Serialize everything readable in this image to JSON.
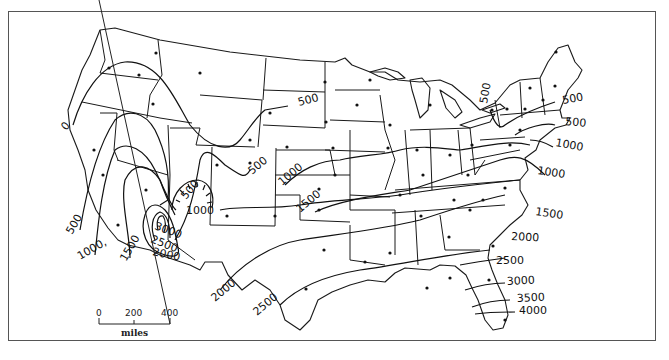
{
  "figure": {
    "type": "contour map of the contiguous United States",
    "contour_labels": [
      {
        "value": "0",
        "x": 66,
        "y": 131,
        "rotate": -50
      },
      {
        "value": "500",
        "x": 72,
        "y": 235,
        "rotate": -60
      },
      {
        "value": "1000,",
        "x": 80,
        "y": 260,
        "rotate": -30
      },
      {
        "value": "1500",
        "x": 126,
        "y": 262,
        "rotate": -60
      },
      {
        "value": "2000",
        "x": 152,
        "y": 255,
        "rotate": 12
      },
      {
        "value": "2500",
        "x": 150,
        "y": 242,
        "rotate": 22
      },
      {
        "value": "3000",
        "x": 154,
        "y": 229,
        "rotate": 20
      },
      {
        "value": "1000",
        "x": 186,
        "y": 214,
        "rotate": 0
      },
      {
        "value": "500",
        "x": 186,
        "y": 200,
        "rotate": -50
      },
      {
        "value": "500",
        "x": 252,
        "y": 175,
        "rotate": -40
      },
      {
        "value": "1000",
        "x": 282,
        "y": 186,
        "rotate": -40
      },
      {
        "value": "500",
        "x": 299,
        "y": 106,
        "rotate": -15
      },
      {
        "value": "1500",
        "x": 300,
        "y": 213,
        "rotate": -40
      },
      {
        "value": "2000",
        "x": 215,
        "y": 302,
        "rotate": -40
      },
      {
        "value": "2500",
        "x": 257,
        "y": 316,
        "rotate": -40
      },
      {
        "value": "500",
        "x": 487,
        "y": 104,
        "rotate": -80
      },
      {
        "value": "500",
        "x": 563,
        "y": 104,
        "rotate": -10
      },
      {
        "value": "500",
        "x": 565,
        "y": 125,
        "rotate": 5
      },
      {
        "value": "1000",
        "x": 555,
        "y": 146,
        "rotate": 10
      },
      {
        "value": "1000",
        "x": 537,
        "y": 174,
        "rotate": 8
      },
      {
        "value": "1500",
        "x": 535,
        "y": 215,
        "rotate": 8
      },
      {
        "value": "2000",
        "x": 511,
        "y": 240,
        "rotate": 3
      },
      {
        "value": "2500",
        "x": 496,
        "y": 264,
        "rotate": 0
      },
      {
        "value": "3000",
        "x": 507,
        "y": 285,
        "rotate": -3
      },
      {
        "value": "3500",
        "x": 517,
        "y": 302,
        "rotate": -3
      },
      {
        "value": "4000",
        "x": 519,
        "y": 314,
        "rotate": 0
      }
    ],
    "contour_values": [
      0,
      500,
      1000,
      1500,
      2000,
      2500,
      3000,
      3500,
      4000
    ]
  },
  "scale_bar": {
    "ticks": [
      "0",
      "200",
      "400"
    ],
    "unit": "miles"
  }
}
